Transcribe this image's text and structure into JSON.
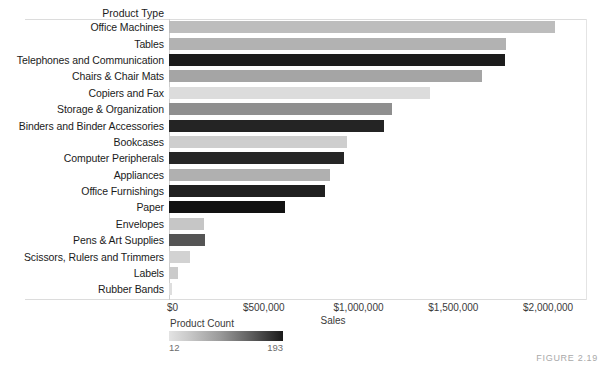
{
  "figure": {
    "caption": "FIGURE 2.19"
  },
  "chart_data": {
    "type": "bar",
    "orientation": "horizontal",
    "title": "",
    "row_header": "Product Type",
    "xlabel": "Sales",
    "ylabel": "Product Type",
    "xlim": [
      0,
      2200000
    ],
    "xticks": [
      0,
      500000,
      1000000,
      1500000,
      2000000
    ],
    "xtick_labels": [
      "$0",
      "$500,000",
      "$1,000,000",
      "$1,500,000",
      "$2,000,000"
    ],
    "grid": false,
    "legend": {
      "title": "Product Count",
      "min": 12,
      "max": 193,
      "min_label": "12",
      "max_label": "193",
      "position": "below-left",
      "ramp_from": "#e3e3e3",
      "ramp_to": "#1a1a1a"
    },
    "categories": [
      "Office Machines",
      "Tables",
      "Telephones and Communication",
      "Chairs & Chair Mats",
      "Copiers and Fax",
      "Storage & Organization",
      "Binders and Binder Accessories",
      "Bookcases",
      "Computer Peripherals",
      "Appliances",
      "Office Furnishings",
      "Paper",
      "Envelopes",
      "Pens & Art Supplies",
      "Scissors, Rulers and Trimmers",
      "Labels",
      "Rubber Bands"
    ],
    "values": [
      2035000,
      1780000,
      1775000,
      1650000,
      1375000,
      1175000,
      1135000,
      940000,
      925000,
      850000,
      825000,
      610000,
      185000,
      190000,
      110000,
      50000,
      15000
    ],
    "color_values": [
      68,
      80,
      186,
      95,
      35,
      108,
      180,
      42,
      176,
      88,
      172,
      193,
      55,
      130,
      40,
      45,
      30
    ],
    "colors": [
      "#bdbdbd",
      "#b2b2b2",
      "#1c1c1c",
      "#a5a5a5",
      "#dcdcdc",
      "#8f8f8f",
      "#242424",
      "#cecece",
      "#262626",
      "#b0b0b0",
      "#202020",
      "#121212",
      "#c6c6c6",
      "#555555",
      "#d2d2d2",
      "#cbcbcb",
      "#dedede"
    ]
  }
}
